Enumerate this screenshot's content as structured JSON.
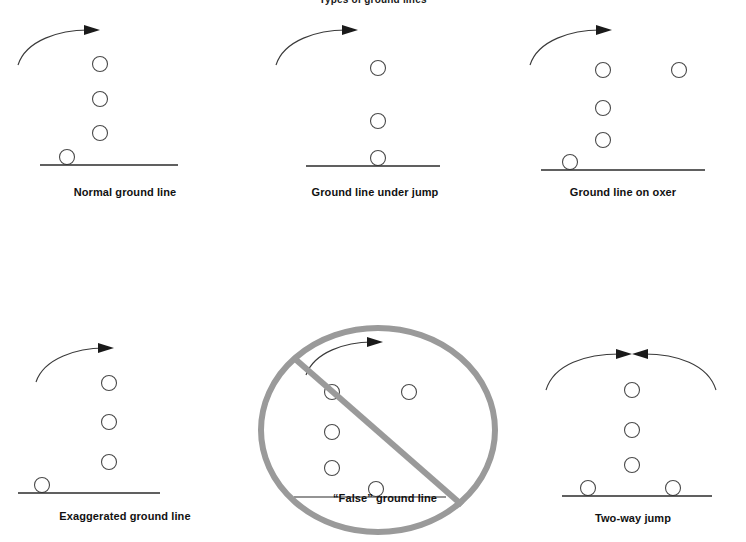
{
  "figure": {
    "title": "Types of ground lines",
    "background_color": "#ffffff",
    "stroke_color": "#3a3a3a",
    "text_color": "#111111",
    "prohibition_color": "#9a9a9a",
    "panel_count": 6
  },
  "panels": [
    {
      "id": "normal-ground-line",
      "caption": "Normal ground line",
      "arrow_count": 1,
      "arrow_direction": "left-to-right",
      "stack_circles": 3,
      "ground_circles": 1,
      "extra_circles": 0,
      "prohibited": false
    },
    {
      "id": "ground-line-under-jump",
      "caption": "Ground line under jump",
      "arrow_count": 1,
      "arrow_direction": "left-to-right",
      "stack_circles": 2,
      "ground_circles": 1,
      "extra_circles": 0,
      "prohibited": false
    },
    {
      "id": "ground-line-on-oxer",
      "caption": "Ground line on oxer",
      "arrow_count": 1,
      "arrow_direction": "left-to-right",
      "stack_circles": 3,
      "ground_circles": 1,
      "extra_circles": 1,
      "prohibited": false
    },
    {
      "id": "exaggerated-ground-line",
      "caption": "Exaggerated ground line",
      "arrow_count": 1,
      "arrow_direction": "left-to-right",
      "stack_circles": 3,
      "ground_circles": 1,
      "extra_circles": 0,
      "prohibited": false
    },
    {
      "id": "false-ground-line",
      "caption": "“False” ground line",
      "arrow_count": 1,
      "arrow_direction": "left-to-right",
      "stack_circles": 3,
      "ground_circles": 1,
      "extra_circles": 1,
      "prohibited": true
    },
    {
      "id": "two-way-jump",
      "caption": "Two-way jump",
      "arrow_count": 2,
      "arrow_direction": "both",
      "stack_circles": 3,
      "ground_circles": 2,
      "extra_circles": 0,
      "prohibited": false
    }
  ]
}
